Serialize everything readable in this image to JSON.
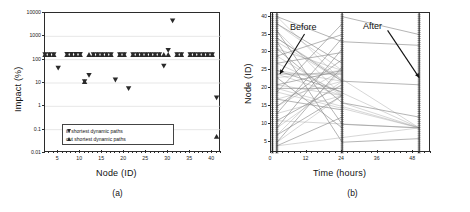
{
  "figure": {
    "panel_a_caption": "(a)",
    "panel_b_caption": "(b)"
  },
  "panel_a": {
    "xlabel": "Node (ID)",
    "ylabel": "Impact (%)",
    "xticks": [
      "5",
      "10",
      "15",
      "20",
      "25",
      "30",
      "35",
      "40"
    ],
    "yticks": [
      "10000",
      "1000",
      "100",
      "10",
      "1",
      "0.1",
      "0.01"
    ],
    "legend": [
      {
        "marker": "triangle-down",
        "label": "in shortest dynamic paths"
      },
      {
        "marker": "triangle-up",
        "label": "out shortest dynamic paths"
      }
    ]
  },
  "panel_b": {
    "xlabel": "Time (hours)",
    "ylabel": "Node (ID)",
    "xticks": [
      "0",
      "12",
      "24",
      "36",
      "48"
    ],
    "yticks": [
      "5",
      "10",
      "15",
      "20",
      "25",
      "30",
      "35",
      "40"
    ],
    "annotations": [
      {
        "label": "Before"
      },
      {
        "label": "After"
      }
    ]
  },
  "chart_data": [
    {
      "type": "scatter",
      "panel": "(a)",
      "title": "",
      "xlabel": "Node (ID)",
      "ylabel": "Impact (%)",
      "xlim": [
        2,
        42
      ],
      "ylim": [
        0.01,
        10000
      ],
      "yscale": "log",
      "xticks": [
        5,
        10,
        15,
        20,
        25,
        30,
        35,
        40
      ],
      "yticks": [
        0.01,
        0.1,
        1,
        10,
        100,
        1000,
        10000
      ],
      "grid": true,
      "legend_position": "lower-center",
      "series": [
        {
          "name": "in shortest dynamic paths",
          "marker": "triangle-down",
          "color": "#2a2a2a",
          "points": [
            [
              2,
              170
            ],
            [
              3,
              170
            ],
            [
              4,
              170
            ],
            [
              5,
              45
            ],
            [
              7,
              175
            ],
            [
              8,
              175
            ],
            [
              9,
              175
            ],
            [
              10,
              175
            ],
            [
              11,
              12
            ],
            [
              12,
              22
            ],
            [
              13,
              170
            ],
            [
              14,
              170
            ],
            [
              15,
              170
            ],
            [
              16,
              170
            ],
            [
              17,
              170
            ],
            [
              18,
              14
            ],
            [
              19,
              170
            ],
            [
              20,
              170
            ],
            [
              21,
              6
            ],
            [
              22,
              170
            ],
            [
              23,
              170
            ],
            [
              24,
              170
            ],
            [
              25,
              170
            ],
            [
              26,
              170
            ],
            [
              27,
              170
            ],
            [
              28,
              170
            ],
            [
              29,
              55
            ],
            [
              30,
              260
            ],
            [
              31,
              4800
            ],
            [
              32,
              170
            ],
            [
              33,
              170
            ],
            [
              35,
              170
            ],
            [
              36,
              170
            ],
            [
              37,
              170
            ],
            [
              38,
              170
            ],
            [
              39,
              170
            ],
            [
              40,
              170
            ],
            [
              41,
              2.4
            ]
          ]
        },
        {
          "name": "out shortest dynamic paths",
          "marker": "triangle-up",
          "color": "#2a2a2a",
          "points": [
            [
              2,
              160
            ],
            [
              3,
              160
            ],
            [
              4,
              160
            ],
            [
              7,
              160
            ],
            [
              8,
              160
            ],
            [
              9,
              160
            ],
            [
              10,
              160
            ],
            [
              11,
              11
            ],
            [
              12,
              160
            ],
            [
              13,
              160
            ],
            [
              14,
              160
            ],
            [
              15,
              160
            ],
            [
              16,
              160
            ],
            [
              17,
              160
            ],
            [
              19,
              160
            ],
            [
              20,
              160
            ],
            [
              22,
              160
            ],
            [
              23,
              160
            ],
            [
              24,
              160
            ],
            [
              25,
              160
            ],
            [
              26,
              160
            ],
            [
              27,
              160
            ],
            [
              28,
              160
            ],
            [
              29,
              160
            ],
            [
              30,
              160
            ],
            [
              32,
              160
            ],
            [
              33,
              160
            ],
            [
              35,
              160
            ],
            [
              36,
              160
            ],
            [
              37,
              160
            ],
            [
              38,
              160
            ],
            [
              39,
              160
            ],
            [
              40,
              160
            ],
            [
              41,
              0.05
            ]
          ]
        }
      ]
    },
    {
      "type": "line",
      "panel": "(b)",
      "title": "",
      "xlabel": "Time (hours)",
      "ylabel": "Node (ID)",
      "xlim": [
        0,
        54
      ],
      "ylim": [
        2,
        41
      ],
      "xticks": [
        0,
        12,
        24,
        36,
        48
      ],
      "yticks": [
        5,
        10,
        15,
        20,
        25,
        30,
        35,
        40
      ],
      "grid": false,
      "annotations": [
        {
          "text": "Before",
          "x": 12,
          "y": 36,
          "points_to_x": 3,
          "points_to_y": 24
        },
        {
          "text": "After",
          "x": 38,
          "y": 37,
          "points_to_x": 50,
          "points_to_y": 23
        }
      ],
      "clusters": [
        {
          "time": 0.5,
          "label": "initial-dense-cluster"
        },
        {
          "time": 2.0,
          "label": "before-dense-cluster"
        },
        {
          "time": 24.0,
          "label": "midpoint-cluster"
        },
        {
          "time": 50.0,
          "label": "after-dense-cluster"
        }
      ],
      "trajectories": [
        [
          [
            2,
            40
          ],
          [
            24,
            33
          ]
        ],
        [
          [
            2,
            38
          ],
          [
            24,
            27
          ]
        ],
        [
          [
            2,
            36
          ],
          [
            24,
            10
          ]
        ],
        [
          [
            2,
            34
          ],
          [
            24,
            22
          ]
        ],
        [
          [
            2,
            33
          ],
          [
            24,
            5
          ]
        ],
        [
          [
            2,
            31
          ],
          [
            24,
            16
          ]
        ],
        [
          [
            2,
            29
          ],
          [
            24,
            35
          ]
        ],
        [
          [
            2,
            27
          ],
          [
            24,
            30
          ]
        ],
        [
          [
            2,
            25
          ],
          [
            24,
            19
          ]
        ],
        [
          [
            2,
            23
          ],
          [
            24,
            9
          ]
        ],
        [
          [
            2,
            21
          ],
          [
            24,
            25
          ]
        ],
        [
          [
            2,
            19
          ],
          [
            24,
            38
          ]
        ],
        [
          [
            2,
            17
          ],
          [
            24,
            14
          ]
        ],
        [
          [
            2,
            15
          ],
          [
            24,
            28
          ]
        ],
        [
          [
            2,
            13
          ],
          [
            24,
            34
          ]
        ],
        [
          [
            2,
            11
          ],
          [
            24,
            21
          ]
        ],
        [
          [
            2,
            9
          ],
          [
            24,
            31
          ]
        ],
        [
          [
            2,
            7
          ],
          [
            24,
            18
          ]
        ],
        [
          [
            2,
            5
          ],
          [
            24,
            26
          ]
        ],
        [
          [
            2,
            4
          ],
          [
            24,
            12
          ]
        ],
        [
          [
            24,
            40
          ],
          [
            50,
            35
          ]
        ],
        [
          [
            24,
            33
          ],
          [
            50,
            32
          ]
        ],
        [
          [
            24,
            22
          ],
          [
            50,
            21
          ]
        ],
        [
          [
            24,
            16
          ],
          [
            50,
            12
          ]
        ],
        [
          [
            24,
            10
          ],
          [
            50,
            9
          ]
        ],
        [
          [
            24,
            5
          ],
          [
            50,
            6
          ]
        ],
        [
          [
            2,
            24
          ],
          [
            24,
            24
          ]
        ],
        [
          [
            2,
            20
          ],
          [
            24,
            20
          ]
        ]
      ]
    }
  ]
}
